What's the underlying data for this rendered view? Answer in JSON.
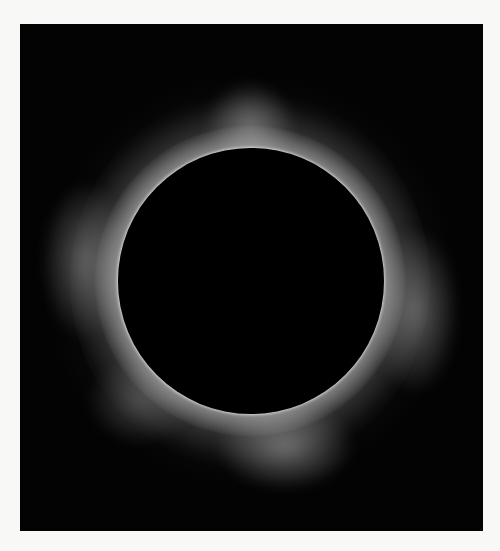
{
  "image": {
    "subject": "total solar eclipse with corona",
    "background_color": "#f8f8f6",
    "frame_color": "#030303",
    "corona_color": "#ffffff",
    "moon_color": "#000000"
  }
}
